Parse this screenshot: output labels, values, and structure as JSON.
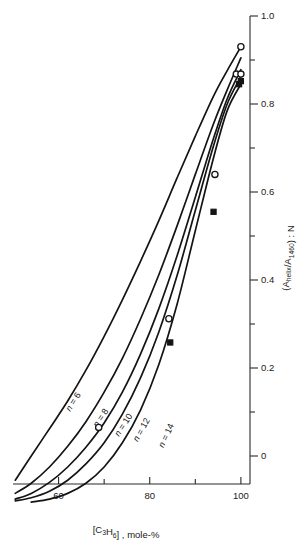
{
  "chart_data": {
    "type": "line",
    "title": "",
    "xlabel": "[C3H6] , mole-%",
    "xlabel_parts": {
      "bracket_open": "[C",
      "sub1": "3",
      "mid": "H",
      "sub2": "6",
      "bracket_close": "] , mole-%"
    },
    "ylabel": "(A helix /A 1460 ) : N",
    "ylabel_parts": {
      "open": "(A",
      "sub1": "helix",
      "slash": "/A",
      "sub2": "1460",
      "close": ") : N"
    },
    "xlim": [
      50,
      102
    ],
    "ylim": [
      -0.08,
      1.0
    ],
    "x_ticks_major": [
      60,
      80,
      100
    ],
    "x_ticks_minor": [
      70,
      90
    ],
    "x_ticklabels": [
      "60",
      "80",
      "100"
    ],
    "y_ticks_major": [
      0,
      0.2,
      0.4,
      0.6,
      0.8,
      1.0
    ],
    "y_ticks_minor": [
      0.1,
      0.3,
      0.5,
      0.7,
      0.9
    ],
    "y_ticklabels": [
      "0",
      "0.2",
      "0.4",
      "0.6",
      "0.8",
      "1.0"
    ],
    "y_axis_position": "right",
    "grid": false,
    "legend": "inline-curve-labels",
    "series": [
      {
        "name": "n = 6",
        "label": "n = 6",
        "n": 6,
        "label_at": {
          "x": 64.5,
          "y": 0.115
        },
        "x": [
          50.5,
          54,
          58,
          62,
          66,
          70,
          74,
          78,
          82,
          86,
          90,
          94,
          97,
          100
        ],
        "y": [
          -0.055,
          0.0,
          0.062,
          0.125,
          0.195,
          0.272,
          0.355,
          0.443,
          0.535,
          0.632,
          0.727,
          0.818,
          0.876,
          0.93
        ]
      },
      {
        "name": "n = 8",
        "label": "n = 8",
        "n": 8,
        "label_at": {
          "x": 70.5,
          "y": 0.078
        },
        "x": [
          50.5,
          54,
          58,
          62,
          66,
          70,
          74,
          78,
          82,
          86,
          90,
          94,
          97,
          100
        ],
        "y": [
          -0.085,
          -0.062,
          -0.025,
          0.022,
          0.078,
          0.145,
          0.222,
          0.312,
          0.412,
          0.523,
          0.64,
          0.755,
          0.832,
          0.905
        ]
      },
      {
        "name": "n = 10",
        "label": "n = 10",
        "n": 10,
        "label_at": {
          "x": 75.5,
          "y": 0.062
        },
        "x": [
          50.5,
          54,
          58,
          62,
          66,
          70,
          74,
          78,
          82,
          86,
          90,
          94,
          97,
          100
        ],
        "y": [
          -0.098,
          -0.085,
          -0.06,
          -0.025,
          0.02,
          0.075,
          0.145,
          0.232,
          0.335,
          0.455,
          0.588,
          0.722,
          0.812,
          0.878
        ]
      },
      {
        "name": "n = 12",
        "label": "n = 12",
        "n": 12,
        "label_at": {
          "x": 79.5,
          "y": 0.052
        },
        "x": [
          50.5,
          54,
          58,
          62,
          66,
          70,
          74,
          78,
          82,
          86,
          90,
          94,
          97,
          100
        ],
        "y": [
          -0.102,
          -0.095,
          -0.08,
          -0.055,
          -0.018,
          0.03,
          0.095,
          0.178,
          0.282,
          0.41,
          0.558,
          0.705,
          0.8,
          0.862
        ]
      },
      {
        "name": "n = 14",
        "label": "n = 14",
        "n": 14,
        "label_at": {
          "x": 85.0,
          "y": 0.04
        },
        "x": [
          54,
          58,
          62,
          66,
          70,
          74,
          78,
          82,
          86,
          90,
          94,
          97,
          100
        ],
        "y": [
          -0.105,
          -0.098,
          -0.085,
          -0.062,
          -0.025,
          0.03,
          0.105,
          0.208,
          0.345,
          0.512,
          0.678,
          0.785,
          0.845
        ]
      }
    ],
    "data_points_open": [
      {
        "x": 68.8,
        "y": 0.065
      },
      {
        "x": 84.2,
        "y": 0.312
      },
      {
        "x": 94.3,
        "y": 0.64
      },
      {
        "x": 99.0,
        "y": 0.868
      },
      {
        "x": 100.0,
        "y": 0.868
      },
      {
        "x": 100.0,
        "y": 0.93
      }
    ],
    "data_points_filled": [
      {
        "x": 84.5,
        "y": 0.258
      },
      {
        "x": 94.0,
        "y": 0.555
      },
      {
        "x": 99.6,
        "y": 0.845
      },
      {
        "x": 100.0,
        "y": 0.852
      }
    ],
    "colors": {
      "curve": "#141414",
      "axis": "#2a2a2a",
      "text": "#1a1a1a",
      "background": "#ffffff"
    }
  }
}
